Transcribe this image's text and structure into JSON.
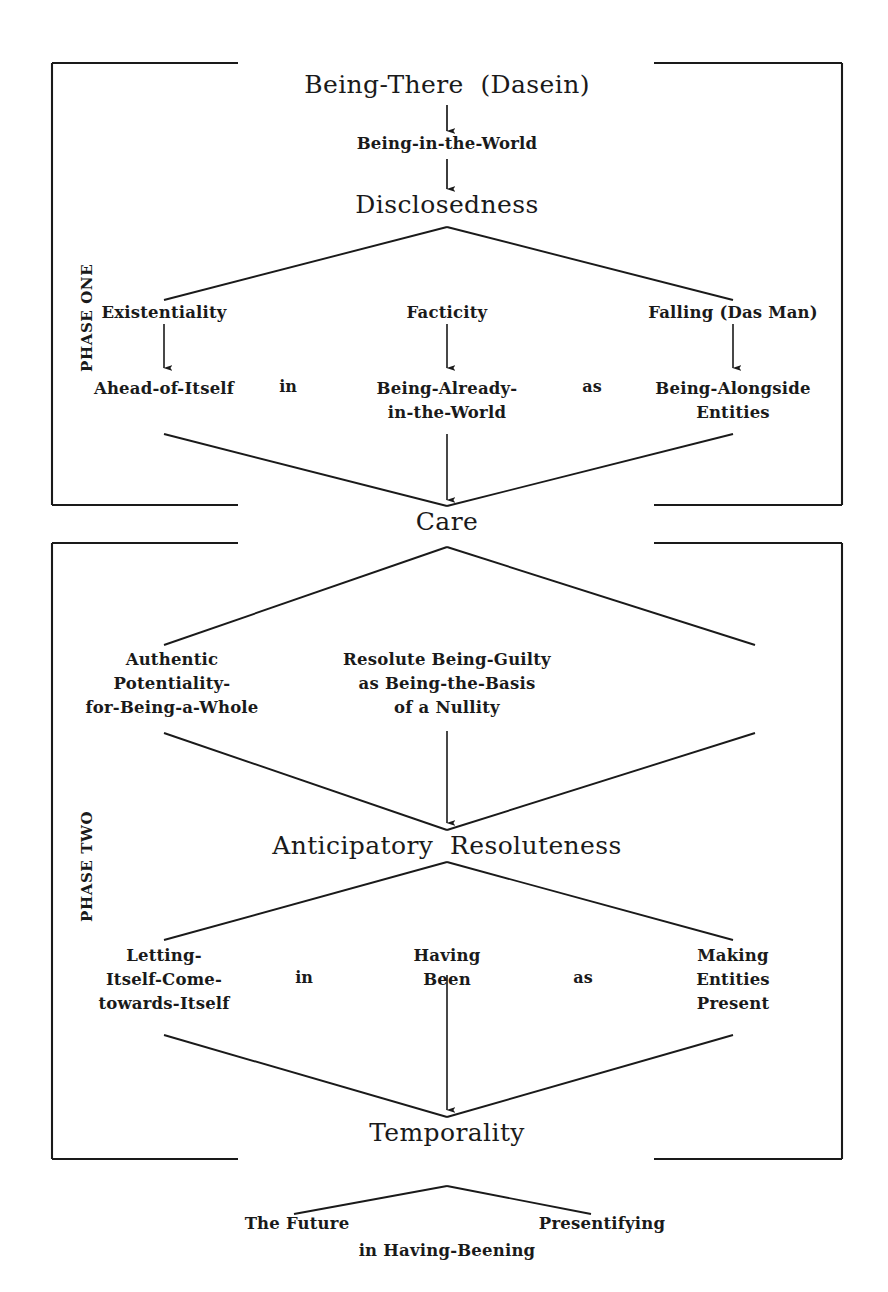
{
  "figure": {
    "ink_color": "#1a1a1a",
    "background_color": "#ffffff"
  },
  "phases": {
    "one": {
      "label": "PHASE ONE"
    },
    "two": {
      "label": "PHASE TWO"
    }
  },
  "nodes": {
    "dasein": "Being-There  (Dasein)",
    "being_in_world": "Being-in-the-World",
    "disclosedness": "Disclosedness",
    "existentiality": "Existentiality",
    "facticity": "Facticity",
    "falling": "Falling (Das Man)",
    "ahead_of_itself": "Ahead-of-Itself",
    "being_already_l1": "Being-Already-",
    "being_already_l2": "in-the-World",
    "being_alongside_l1": "Being-Alongside",
    "being_alongside_l2": "Entities",
    "care": "Care",
    "authentic_l1": "Authentic",
    "authentic_l2": "Potentiality-",
    "authentic_l3": "for-Being-a-Whole",
    "resolute_l1": "Resolute Being-Guilty",
    "resolute_l2": "as Being-the-Basis",
    "resolute_l3": "of a Nullity",
    "anticipatory_resoluteness": "Anticipatory  Resoluteness",
    "letting_l1": "Letting-",
    "letting_l2": "Itself-Come-",
    "letting_l3": "towards-Itself",
    "having_l1": "Having",
    "having_l2": "Been",
    "making_l1": "Making",
    "making_l2": "Entities",
    "making_l3": "Present",
    "temporality": "Temporality",
    "the_future": "The Future",
    "presentifying": "Presentifying",
    "in_having_beening": "in Having-Beening"
  },
  "connectors": {
    "in_one": "in",
    "as_one": "as",
    "in_two": "in",
    "as_two": "as"
  }
}
